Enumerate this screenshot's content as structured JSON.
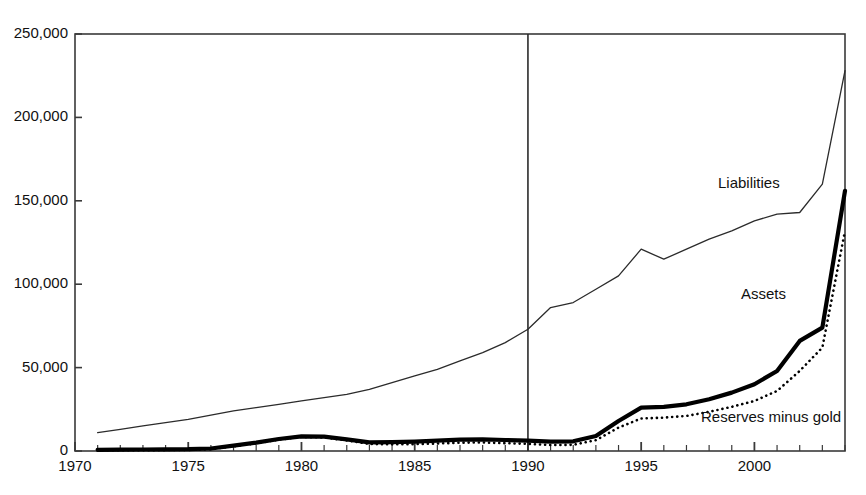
{
  "chart_data": {
    "type": "line",
    "title": "",
    "subtitle": "",
    "xlabel": "",
    "ylabel": "",
    "xlim": [
      1970,
      2004
    ],
    "ylim": [
      0,
      250000
    ],
    "grid": false,
    "legend_position": "inline-labels",
    "ytick_labels": [
      "0",
      "50,000",
      "100,000",
      "150,000",
      "200,000",
      "250,000"
    ],
    "ytick_values": [
      0,
      50000,
      100000,
      150000,
      200000,
      250000
    ],
    "xtick_labels": [
      "1970",
      "1975",
      "1980",
      "1985",
      "1990",
      "1995",
      "2000"
    ],
    "xtick_values": [
      1970,
      1975,
      1980,
      1985,
      1990,
      1995,
      2000
    ],
    "minor_xticks": "every 1 year",
    "annotations": [
      {
        "text": "vertical reference line at 1990",
        "x": 1990
      }
    ],
    "x": [
      1971,
      1972,
      1973,
      1974,
      1975,
      1976,
      1977,
      1978,
      1979,
      1980,
      1981,
      1982,
      1983,
      1984,
      1985,
      1986,
      1987,
      1988,
      1989,
      1990,
      1991,
      1992,
      1993,
      1994,
      1995,
      1996,
      1997,
      1998,
      1999,
      2000,
      2001,
      2002,
      2003,
      2004
    ],
    "series": [
      {
        "name": "Liabilities",
        "style": "thin-solid",
        "color": "#2b2b2b",
        "values": [
          11000,
          13000,
          15000,
          17000,
          19000,
          21500,
          24000,
          26000,
          28000,
          30000,
          32000,
          34000,
          37000,
          41000,
          45000,
          49000,
          54000,
          59000,
          65000,
          73000,
          86000,
          89000,
          97000,
          105000,
          121000,
          115000,
          121000,
          127000,
          132000,
          138000,
          142000,
          143000,
          160000,
          228000
        ]
      },
      {
        "name": "Assets",
        "style": "thick-solid",
        "color": "#000000",
        "values": [
          700,
          800,
          900,
          1000,
          1100,
          1500,
          3200,
          5000,
          7200,
          8800,
          8600,
          7000,
          5200,
          5300,
          5600,
          6200,
          6800,
          7000,
          6600,
          6200,
          5600,
          5800,
          9000,
          18000,
          26000,
          26500,
          28000,
          31000,
          35000,
          40000,
          48000,
          66000,
          74000,
          156000
        ]
      },
      {
        "name": "Reserves minus gold",
        "style": "dotted",
        "color": "#000000",
        "values": [
          400,
          450,
          500,
          550,
          600,
          1100,
          2800,
          4600,
          6800,
          8400,
          8100,
          6300,
          4200,
          4000,
          4100,
          4500,
          5000,
          5100,
          4700,
          4300,
          3600,
          3700,
          6500,
          14000,
          19500,
          20000,
          21000,
          23500,
          26500,
          30000,
          36000,
          48000,
          62000,
          132000
        ]
      }
    ]
  },
  "axis": {
    "vertical_marker_year": 1990
  },
  "series_labels": {
    "liabilities": "Liabilities",
    "assets": "Assets",
    "reserves": "Reserves minus gold"
  }
}
